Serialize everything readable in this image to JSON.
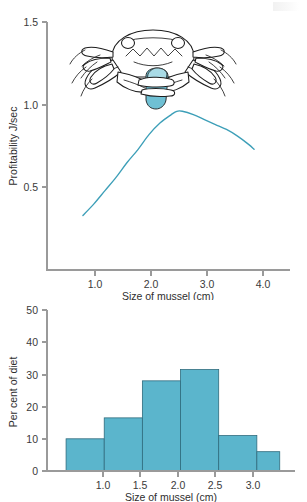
{
  "page": {
    "background_color": "#ffffff",
    "accent_color": "#5bb5cc",
    "curve_color": "#3d9fb8",
    "axis_color": "#9a9a9a"
  },
  "illustration": {
    "name": "crab-holding-mussel",
    "caption": "",
    "subject": "shore crab grasping a mussel with its claws",
    "shell_color": "#6fc0d4"
  },
  "chart_data": [
    {
      "id": "profitability-curve",
      "type": "line",
      "title": "",
      "xlabel": "Size of mussel (cm)",
      "ylabel": "Profitability J/sec",
      "xlim": [
        0.35,
        4.75
      ],
      "ylim": [
        0.0,
        1.5
      ],
      "xticks": [
        "1.0",
        "2.0",
        "3.0",
        "4.0"
      ],
      "xtick_values": [
        1.0,
        2.0,
        3.0,
        4.0
      ],
      "yticks": [
        "0.5",
        "1.0",
        "1.5"
      ],
      "ytick_values": [
        0.5,
        1.0,
        1.5
      ],
      "grid": false,
      "legend": "none",
      "series": [
        {
          "name": "Profitability",
          "color": "#3d9fb8",
          "x": [
            1.0,
            1.2,
            1.4,
            1.6,
            1.8,
            2.0,
            2.2,
            2.4,
            2.6,
            2.7,
            2.8,
            3.0,
            3.2,
            3.4,
            3.6,
            3.8,
            4.0,
            4.1
          ],
          "y": [
            0.33,
            0.4,
            0.48,
            0.56,
            0.65,
            0.73,
            0.82,
            0.89,
            0.94,
            0.96,
            0.96,
            0.94,
            0.91,
            0.88,
            0.85,
            0.81,
            0.76,
            0.73
          ]
        }
      ]
    },
    {
      "id": "diet-histogram",
      "type": "bar",
      "title": "",
      "xlabel": "Size of mussel (cm)",
      "ylabel": "Per cent of diet",
      "xlim": [
        0.4,
        3.65
      ],
      "ylim": [
        0,
        50
      ],
      "xticks": [
        "1.0",
        "1.5",
        "2.0",
        "2.5",
        "3.0"
      ],
      "xtick_values": [
        1.0,
        1.5,
        2.0,
        2.5,
        3.0
      ],
      "yticks": [
        "0",
        "10",
        "20",
        "30",
        "40",
        "50"
      ],
      "ytick_values": [
        0,
        10,
        20,
        30,
        40,
        50
      ],
      "grid": false,
      "legend": "none",
      "bin_edges": [
        0.65,
        1.15,
        1.65,
        2.15,
        2.65,
        3.15,
        3.45
      ],
      "categories": [
        "0.65-1.15",
        "1.15-1.65",
        "1.65-2.15",
        "2.15-2.65",
        "2.65-3.15",
        "3.15-3.45"
      ],
      "values": [
        10,
        16.5,
        28,
        31.5,
        11,
        6
      ],
      "bar_color": "#5bb5cc"
    }
  ]
}
